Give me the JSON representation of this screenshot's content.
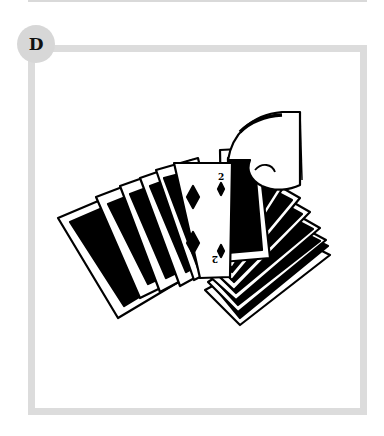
{
  "panel": {
    "step_label": "D",
    "frame_color": "#dcdcdc",
    "badge_color": "#d7d7d7"
  },
  "illustration": {
    "subject": "hand fanning a deck of playing cards",
    "face_card": {
      "rank": "2",
      "suit": "diamonds"
    }
  }
}
